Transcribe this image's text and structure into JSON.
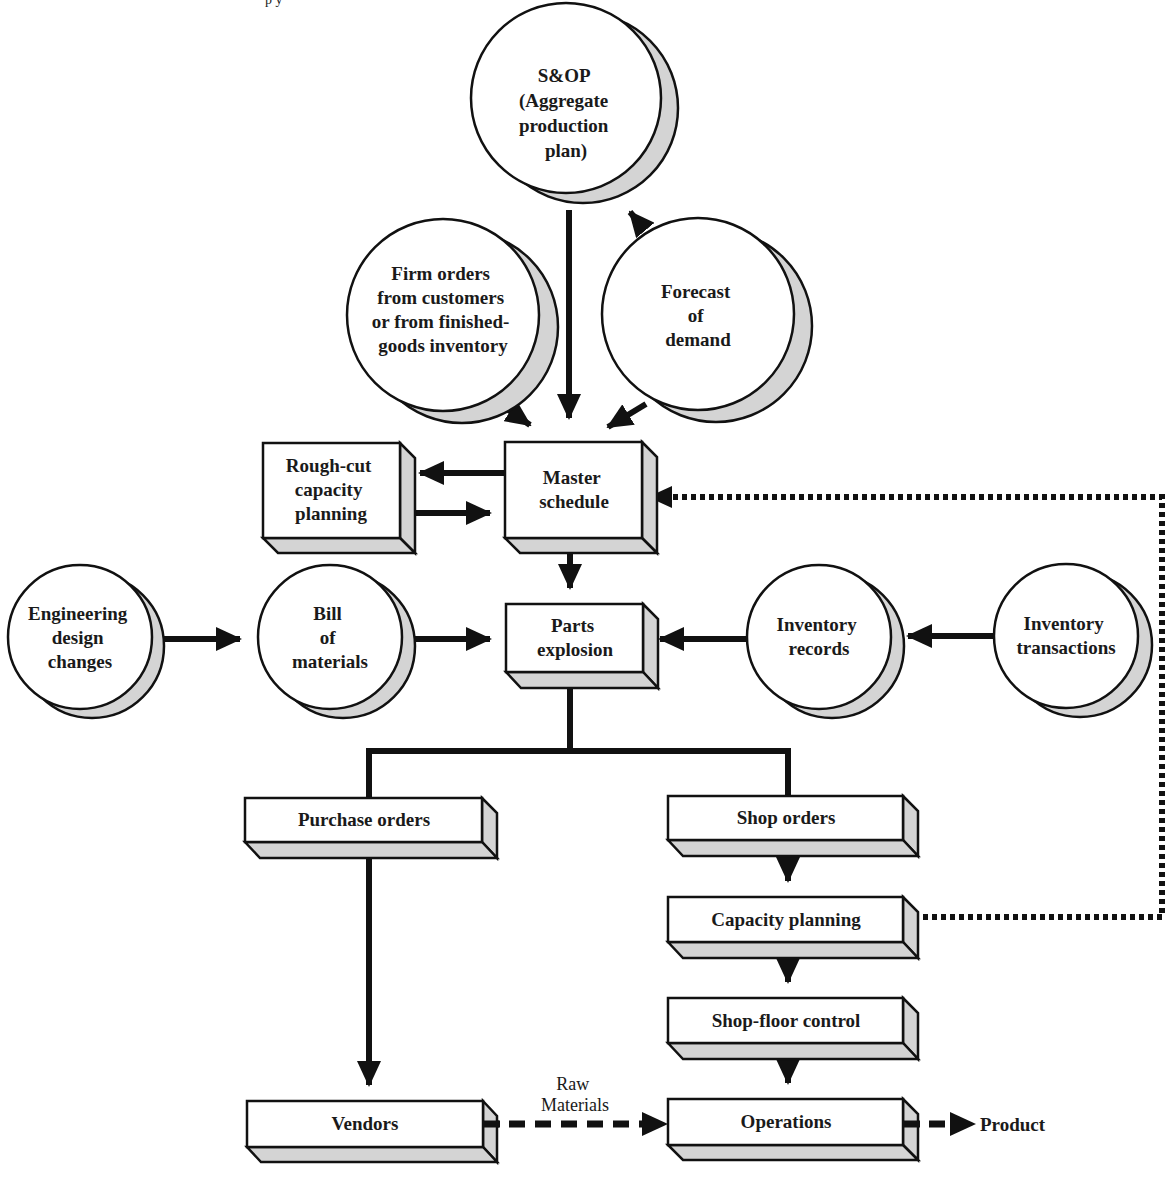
{
  "colors": {
    "line": "#111111",
    "shade": "#d4d4d4",
    "face": "#ffffff"
  },
  "top_fragment": "p   y",
  "circles": {
    "sop": {
      "lines": [
        "S&OP",
        "(Aggregate",
        "production",
        "plan)"
      ]
    },
    "firm_orders": {
      "lines": [
        "Firm orders",
        "from customers",
        "or from finished-",
        "goods inventory"
      ]
    },
    "forecast": {
      "lines": [
        "Forecast",
        "of",
        "demand"
      ]
    },
    "engineering": {
      "lines": [
        "Engineering",
        "design",
        "changes"
      ]
    },
    "bom": {
      "lines": [
        "Bill",
        "of",
        "materials"
      ]
    },
    "inventory_records": {
      "lines": [
        "Inventory",
        "records"
      ]
    },
    "inventory_transactions": {
      "lines": [
        "Inventory",
        "transactions"
      ]
    }
  },
  "boxes": {
    "rough_cut": {
      "lines": [
        "Rough-cut",
        "capacity",
        "planning"
      ]
    },
    "master_schedule": {
      "lines": [
        "Master",
        "schedule"
      ]
    },
    "parts_explosion": {
      "lines": [
        "Parts",
        "explosion"
      ]
    },
    "purchase_orders": {
      "lines": [
        "Purchase orders"
      ]
    },
    "shop_orders": {
      "lines": [
        "Shop orders"
      ]
    },
    "capacity_planning": {
      "lines": [
        "Capacity planning"
      ]
    },
    "shop_floor_control": {
      "lines": [
        "Shop-floor control"
      ]
    },
    "vendors": {
      "lines": [
        "Vendors"
      ]
    },
    "operations": {
      "lines": [
        "Operations"
      ]
    }
  },
  "labels": {
    "raw_materials": [
      "Raw",
      "Materials"
    ],
    "product": "Product"
  }
}
